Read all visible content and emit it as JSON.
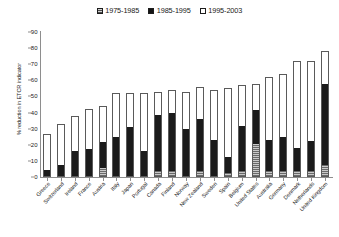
{
  "chart_data": {
    "type": "bar",
    "subtype": "stacked-vertical",
    "title": "",
    "xlabel": "",
    "ylabel": "% reduction in ETCR indicator",
    "ylim": [
      0,
      90
    ],
    "yticks": [
      0,
      10,
      20,
      30,
      40,
      50,
      60,
      70,
      80,
      90
    ],
    "grid": false,
    "legend_position": "top-center",
    "categories": [
      "Greece",
      "Switzerland",
      "Ireland",
      "France",
      "Austria",
      "Italy",
      "Japan",
      "Portugal",
      "Canada",
      "Finland",
      "Norway",
      "New Zealand",
      "Sweden",
      "Spain",
      "Belgium",
      "United States",
      "Australia",
      "Germany",
      "Denmark",
      "Netherlands",
      "United Kingdom"
    ],
    "series": [
      {
        "name": "1975-1985",
        "color": "#8a8a8a",
        "pattern": "grey-hatch",
        "values": [
          0,
          0,
          0,
          0,
          5,
          0,
          0,
          0,
          3,
          3,
          0,
          3,
          0,
          2,
          3,
          20,
          3,
          3,
          3,
          3,
          7
        ]
      },
      {
        "name": "1985-1995",
        "color": "#1b1b1b",
        "pattern": "solid-black",
        "values": [
          4,
          7,
          16,
          17,
          17,
          25,
          31,
          16,
          36,
          37,
          30,
          33,
          23,
          10,
          29,
          22,
          20,
          22,
          15,
          19,
          51
        ]
      },
      {
        "name": "1995-2003",
        "color": "#ffffff",
        "pattern": "white",
        "values": [
          23,
          26,
          22,
          25,
          22,
          27,
          21,
          36,
          14,
          14,
          23,
          20,
          31,
          43,
          25,
          16,
          39,
          39,
          54,
          50,
          20
        ]
      }
    ],
    "totals": [
      27,
      33,
      38,
      42,
      44,
      52,
      52,
      52,
      53,
      54,
      53,
      56,
      54,
      55,
      57,
      58,
      62,
      64,
      72,
      72,
      78
    ]
  },
  "legend": {
    "items": [
      {
        "label": "1975-1985",
        "swatch": "grey-hatch-swatch"
      },
      {
        "label": "1985-1995",
        "swatch": "black-swatch"
      },
      {
        "label": "1995-2003",
        "swatch": "white-swatch"
      }
    ]
  },
  "axis": {
    "y_title": "% reduction in ETCR indicator"
  }
}
